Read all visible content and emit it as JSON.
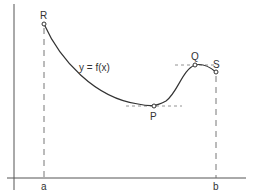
{
  "diagram": {
    "title": "",
    "curve_label": "y = f(x)",
    "points": [
      {
        "id": "R",
        "label": "R",
        "x": 44,
        "y": 24,
        "note": "left endpoint at x=a"
      },
      {
        "id": "P",
        "label": "P",
        "x": 154,
        "y": 106,
        "note": "local minimum, horizontal tangent"
      },
      {
        "id": "Q",
        "label": "Q",
        "x": 195,
        "y": 65,
        "note": "local maximum, horizontal tangent"
      },
      {
        "id": "S",
        "label": "S",
        "x": 216,
        "y": 72,
        "note": "right endpoint at x=b"
      }
    ],
    "x_ticks": [
      {
        "label": "a",
        "x": 44
      },
      {
        "label": "b",
        "x": 216
      }
    ],
    "colors": {
      "curve": "#333333",
      "axis": "#555555",
      "dashed": "#666666",
      "text": "#333333"
    }
  }
}
